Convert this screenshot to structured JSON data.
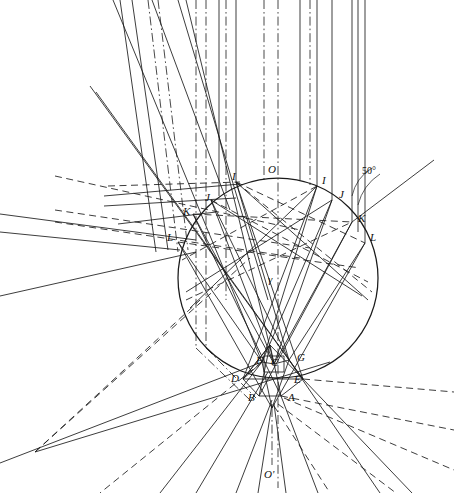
{
  "figure": {
    "kind": "geometric-optics-ray-diagram",
    "background_color": "#ffffff",
    "line_color": "#1a1a1a",
    "width": 454,
    "height": 493
  },
  "circle": {
    "center_x": 278,
    "center_y": 278,
    "radius": 100,
    "label_top": "O",
    "label_bottom": "O'",
    "label_center_ray": "γ"
  },
  "angle": {
    "value": "50°",
    "x": 362,
    "y": 166
  },
  "labels": [
    {
      "text": "O",
      "x": 268,
      "y": 164,
      "name": "label-O"
    },
    {
      "text": "γ",
      "x": 268,
      "y": 274,
      "name": "label-gamma"
    },
    {
      "text": "O'",
      "x": 264,
      "y": 469,
      "name": "label-O-prime"
    },
    {
      "text": "I",
      "x": 232,
      "y": 171,
      "name": "label-I-left"
    },
    {
      "text": "J",
      "x": 205,
      "y": 192,
      "name": "label-J-left"
    },
    {
      "text": "K",
      "x": 183,
      "y": 206,
      "name": "label-K-left"
    },
    {
      "text": "L",
      "x": 167,
      "y": 232,
      "name": "label-L-left"
    },
    {
      "text": "I",
      "x": 322,
      "y": 175,
      "name": "label-I-right"
    },
    {
      "text": "J",
      "x": 339,
      "y": 189,
      "name": "label-J-right"
    },
    {
      "text": "K",
      "x": 358,
      "y": 213,
      "name": "label-K-right"
    },
    {
      "text": "L",
      "x": 370,
      "y": 232,
      "name": "label-L-right"
    },
    {
      "text": "F",
      "x": 256,
      "y": 355,
      "name": "label-F"
    },
    {
      "text": "C",
      "x": 271,
      "y": 357,
      "name": "label-C"
    },
    {
      "text": "G",
      "x": 297,
      "y": 352,
      "name": "label-G"
    },
    {
      "text": "D",
      "x": 231,
      "y": 373,
      "name": "label-D"
    },
    {
      "text": "E",
      "x": 294,
      "y": 374,
      "name": "label-E"
    },
    {
      "text": "B",
      "x": 248,
      "y": 392,
      "name": "label-B"
    },
    {
      "text": "A",
      "x": 288,
      "y": 392,
      "name": "label-A"
    }
  ],
  "incident_rays": {
    "type": "vertical-parallel",
    "solid_x": [
      152,
      219,
      300,
      337,
      352,
      359,
      366
    ],
    "dashdot_x": [
      196,
      206,
      236,
      264,
      278,
      310
    ],
    "top_y": 0,
    "note": "parallel beam entering from top of figure"
  },
  "points": {
    "entry_left": [
      {
        "n": "I",
        "x": 236,
        "y": 182
      },
      {
        "n": "J",
        "x": 211,
        "y": 200
      },
      {
        "n": "K",
        "x": 193,
        "y": 214
      },
      {
        "n": "L",
        "x": 178,
        "y": 242
      }
    ],
    "entry_right": [
      {
        "n": "I",
        "x": 317,
        "y": 186
      },
      {
        "n": "J",
        "x": 332,
        "y": 200
      },
      {
        "n": "K",
        "x": 352,
        "y": 222
      },
      {
        "n": "L",
        "x": 365,
        "y": 243
      }
    ],
    "cluster": [
      {
        "n": "F",
        "x": 262,
        "y": 362
      },
      {
        "n": "C",
        "x": 274,
        "y": 364
      },
      {
        "n": "G",
        "x": 289,
        "y": 360
      },
      {
        "n": "D",
        "x": 243,
        "y": 379
      },
      {
        "n": "E",
        "x": 303,
        "y": 379
      },
      {
        "n": "B",
        "x": 259,
        "y": 396
      },
      {
        "n": "A",
        "x": 281,
        "y": 396
      },
      {
        "n": "apex",
        "x": 270,
        "y": 345
      },
      {
        "n": "foot",
        "x": 272,
        "y": 408
      }
    ]
  },
  "convergence": {
    "left_focus_x": 35,
    "left_focus_y": 452,
    "bottom_focus_x": 272,
    "bottom_focus_y": 410
  }
}
